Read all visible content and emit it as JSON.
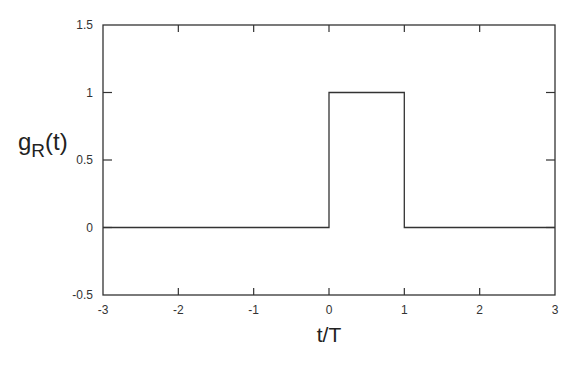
{
  "chart_data": {
    "type": "line",
    "title": "",
    "xlabel": "t/T",
    "ylabel": "g_R(t)",
    "ylabel_main": "g",
    "ylabel_sub": "R",
    "ylabel_suffix": "(t)",
    "xlim": [
      -3,
      3
    ],
    "ylim": [
      -0.5,
      1.5
    ],
    "xticks": [
      -3,
      -2,
      -1,
      0,
      1,
      2,
      3
    ],
    "xtick_labels": [
      "-3",
      "-2",
      "-1",
      "0",
      "1",
      "2",
      "3"
    ],
    "yticks": [
      -0.5,
      0,
      0.5,
      1,
      1.5
    ],
    "ytick_labels": [
      "-0.5",
      "0",
      "0.5",
      "1",
      "1.5"
    ],
    "grid": false,
    "legend": null,
    "series": [
      {
        "name": "g_R(t) rectangular pulse",
        "x": [
          -3,
          0,
          0,
          1,
          1,
          3
        ],
        "y": [
          0,
          0,
          1,
          1,
          0,
          0
        ]
      }
    ]
  },
  "colors": {
    "line": "#333333",
    "axes": "#333333",
    "background": "#ffffff"
  }
}
